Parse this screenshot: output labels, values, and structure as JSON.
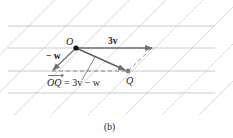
{
  "figure": {
    "caption": "(b)",
    "labels": {
      "origin": "O",
      "point_q": "Q",
      "vec_3v": "3v",
      "vec_neg_w": "− w",
      "equation_lhs": "OQ",
      "equation_rhs": " = 3v − w"
    }
  },
  "geometry": {
    "horizontal_lines_y": [
      26,
      48,
      71,
      93
    ],
    "x_start": 8,
    "x_end": 215,
    "origin": [
      76,
      48
    ],
    "q": [
      128,
      71
    ],
    "tip_3v": [
      152,
      48
    ],
    "tip_neg_w": [
      52,
      71
    ]
  },
  "colors": {
    "grid": "#c8c8c8",
    "vector": "#707070",
    "point_o": "#111111",
    "point_q": "#808080",
    "text": "#222222"
  }
}
